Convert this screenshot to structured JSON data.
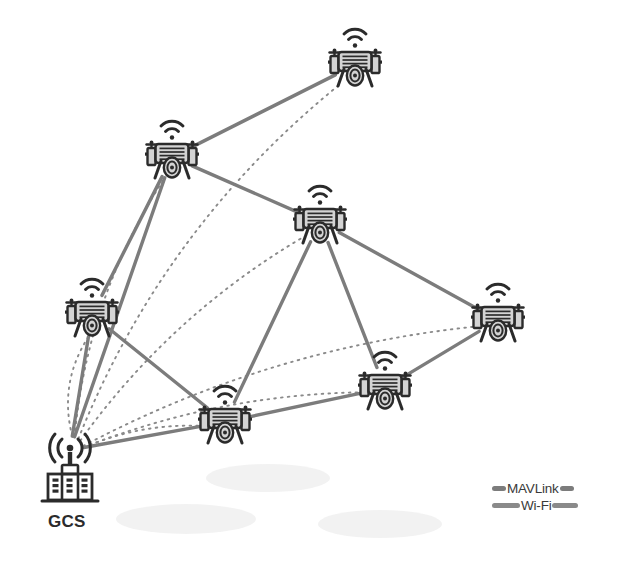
{
  "diagram": {
    "background": "#ffffff",
    "width": 618,
    "height": 567
  },
  "colors": {
    "mavlink_line": "#7c7c7c",
    "wifi_line": "#8a8a8a",
    "drone_stroke": "#2b2b2b",
    "drone_fill": "#d4d4d4",
    "ground_shadow": "#f0f0f0",
    "label_text": "#2b2b2b",
    "legend_text": "#3a3a3a"
  },
  "nodes": [
    {
      "id": "uav-top",
      "name": "uav-top",
      "type": "drone",
      "x": 355,
      "y": 65,
      "scale": 1.0
    },
    {
      "id": "uav-upper-left",
      "name": "uav-upper-left",
      "type": "drone",
      "x": 172,
      "y": 157,
      "scale": 1.0
    },
    {
      "id": "uav-center",
      "name": "uav-center",
      "type": "drone",
      "x": 320,
      "y": 222,
      "scale": 1.0
    },
    {
      "id": "uav-left",
      "name": "uav-left",
      "type": "drone",
      "x": 92,
      "y": 315,
      "scale": 1.0
    },
    {
      "id": "uav-right",
      "name": "uav-right",
      "type": "drone",
      "x": 498,
      "y": 320,
      "scale": 1.0
    },
    {
      "id": "uav-bottom-right",
      "name": "uav-bottom-right",
      "type": "drone",
      "x": 385,
      "y": 388,
      "scale": 1.0
    },
    {
      "id": "uav-bottom-center",
      "name": "uav-bottom-center",
      "type": "drone",
      "x": 225,
      "y": 422,
      "scale": 1.0
    },
    {
      "id": "gcs",
      "name": "ground-control-station",
      "type": "station",
      "x": 70,
      "y": 450,
      "label": "GCS"
    }
  ],
  "gcs": {
    "label": "GCS",
    "label_x": 48,
    "label_y": 512,
    "antenna_x": 70,
    "antenna_y": 450
  },
  "mavlink_links": [
    {
      "from": "uav-top",
      "to": "uav-upper-left"
    },
    {
      "from": "uav-upper-left",
      "to": "uav-center"
    },
    {
      "from": "uav-upper-left",
      "to": "gcs"
    },
    {
      "from": "uav-left",
      "to": "gcs"
    },
    {
      "from": "uav-left",
      "to": "uav-upper-left"
    },
    {
      "from": "uav-left",
      "to": "uav-bottom-center"
    },
    {
      "from": "uav-center",
      "to": "uav-right"
    },
    {
      "from": "uav-center",
      "to": "uav-bottom-center"
    },
    {
      "from": "uav-center",
      "to": "uav-bottom-right"
    },
    {
      "from": "uav-right",
      "to": "uav-bottom-right"
    },
    {
      "from": "uav-bottom-right",
      "to": "uav-bottom-center"
    },
    {
      "from": "uav-bottom-center",
      "to": "gcs"
    }
  ],
  "wifi_links": [
    {
      "from": "gcs",
      "to": "uav-top",
      "bow": -58
    },
    {
      "from": "gcs",
      "to": "uav-upper-left",
      "bow": -34
    },
    {
      "from": "gcs",
      "to": "uav-center",
      "bow": -32
    },
    {
      "from": "gcs",
      "to": "uav-left",
      "bow": -22
    },
    {
      "from": "gcs",
      "to": "uav-right",
      "bow": -40
    },
    {
      "from": "gcs",
      "to": "uav-bottom-right",
      "bow": -26
    },
    {
      "from": "gcs",
      "to": "uav-bottom-center",
      "bow": -14
    }
  ],
  "ground_shadows": [
    {
      "cx": 268,
      "cy": 478,
      "rx": 62,
      "ry": 14
    },
    {
      "cx": 186,
      "cy": 519,
      "rx": 70,
      "ry": 15
    },
    {
      "cx": 380,
      "cy": 524,
      "rx": 62,
      "ry": 14
    }
  ],
  "legend": {
    "x": 492,
    "y": 480,
    "items": [
      {
        "id": "mavlink",
        "label": "MAVLink",
        "style": "solid",
        "color": "#7c7c7c",
        "left_bar_width": 14,
        "right_bar_width": 14
      },
      {
        "id": "wifi",
        "label": "Wi-Fi",
        "style": "dotted",
        "color": "#8a8a8a",
        "left_bar_width": 28,
        "right_bar_width": 26
      }
    ]
  },
  "icons": {
    "drone": "quadcopter-drone-icon",
    "wifi_signal": "wifi-signal-icon",
    "gcs_tower": "radio-tower-icon",
    "gcs_building": "building-icon"
  }
}
